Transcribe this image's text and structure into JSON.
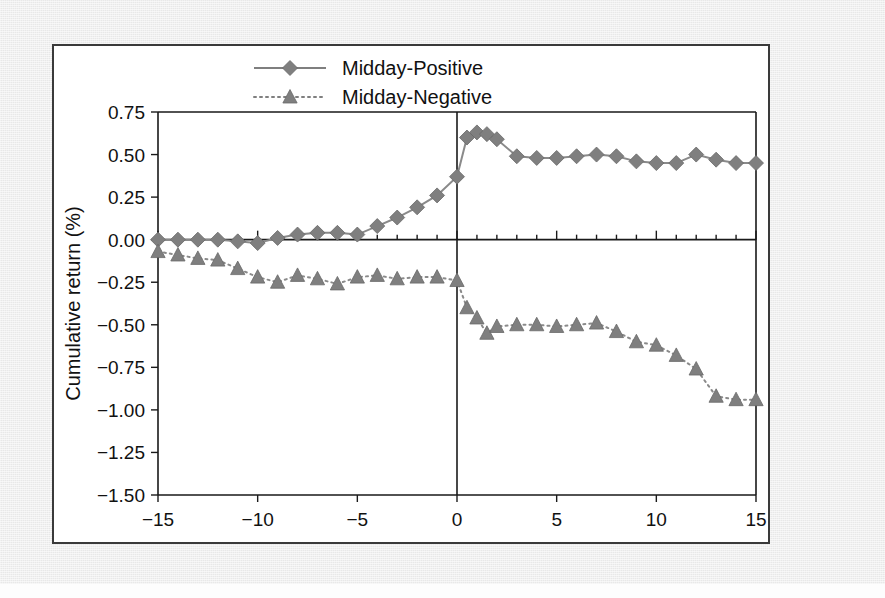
{
  "figure": {
    "background_color": "#e8e8e8",
    "card_background": "#ffffff",
    "series_color": "#7f7f7f",
    "axis_color": "#1a1a1a"
  },
  "legend": {
    "position": "top-center",
    "entries": [
      {
        "label": "Midday-Positive",
        "marker": "diamond",
        "line_style": "solid"
      },
      {
        "label": "Midday-Negative",
        "marker": "triangle",
        "line_style": "dotted"
      }
    ]
  },
  "chart_data": {
    "type": "line",
    "title": "",
    "subtitle": "",
    "xlabel": "Minutes relative to mention",
    "ylabel": "Cumulative return (%)",
    "xlim": [
      -15,
      15
    ],
    "ylim": [
      -1.5,
      0.75
    ],
    "grid": false,
    "legend_position": "top-center",
    "xticks": [
      -15,
      -10,
      -5,
      0,
      5,
      10,
      15
    ],
    "xtick_labels": [
      "−15",
      "−10",
      "−5",
      "0",
      "5",
      "10",
      "15"
    ],
    "yticks": [
      0.75,
      0.5,
      0.25,
      0,
      -0.25,
      -0.5,
      -0.75,
      -1.0,
      -1.25,
      -1.5
    ],
    "ytick_labels": [
      "0.75",
      "0.50",
      "0.25",
      "0.00",
      "−0.25",
      "−0.50",
      "−0.75",
      "−1.00",
      "−1.25",
      "−1.50"
    ],
    "annotations": [
      {
        "type": "vline",
        "x": 0,
        "label": "mention time"
      }
    ],
    "x": [
      -15,
      -14,
      -13,
      -12,
      -11,
      -10,
      -9,
      -8,
      -7,
      -6,
      -5,
      -4,
      -3,
      -2,
      -1,
      0,
      0.5,
      1,
      1.5,
      2,
      3,
      4,
      5,
      6,
      7,
      8,
      9,
      10,
      11,
      12,
      13,
      14,
      15
    ],
    "series": [
      {
        "name": "Midday-Positive",
        "marker": "diamond",
        "line_style": "solid",
        "values": [
          0.0,
          0.0,
          0.0,
          0.0,
          -0.01,
          -0.02,
          0.01,
          0.03,
          0.04,
          0.04,
          0.03,
          0.08,
          0.13,
          0.19,
          0.26,
          0.37,
          0.6,
          0.63,
          0.62,
          0.59,
          0.49,
          0.48,
          0.48,
          0.49,
          0.5,
          0.49,
          0.46,
          0.45,
          0.45,
          0.5,
          0.47,
          0.45,
          0.45
        ]
      },
      {
        "name": "Midday-Negative",
        "marker": "triangle",
        "line_style": "dotted",
        "values": [
          -0.07,
          -0.09,
          -0.11,
          -0.12,
          -0.17,
          -0.22,
          -0.25,
          -0.21,
          -0.23,
          -0.26,
          -0.22,
          -0.21,
          -0.23,
          -0.22,
          -0.22,
          -0.24,
          -0.4,
          -0.46,
          -0.55,
          -0.51,
          -0.5,
          -0.5,
          -0.51,
          -0.5,
          -0.49,
          -0.54,
          -0.6,
          -0.62,
          -0.68,
          -0.76,
          -0.92,
          -0.94,
          -0.94
        ]
      }
    ]
  }
}
